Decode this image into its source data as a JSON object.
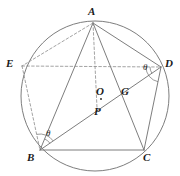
{
  "figure": {
    "kind": "circle-geometry-diagram",
    "width": 180,
    "height": 176,
    "background_color": "#ffffff",
    "stroke_color": "#6e6e6e",
    "dashed_color": "#8c8c8c",
    "label_color": "#1a1a1a"
  },
  "circle": {
    "name": "circumcircle",
    "center_x": 95,
    "center_y": 96,
    "radius_x": 74,
    "radius_y": 75
  },
  "points": [
    {
      "id": "A",
      "label": "A",
      "x": 93,
      "y": 23,
      "label_x": 88,
      "label_y": 6,
      "marker": false
    },
    {
      "id": "E",
      "label": "E",
      "x": 22,
      "y": 66,
      "label_x": 6,
      "label_y": 58,
      "marker": false
    },
    {
      "id": "D",
      "label": "D",
      "x": 161,
      "y": 67,
      "label_x": 165,
      "label_y": 58,
      "marker": false
    },
    {
      "id": "B",
      "label": "B",
      "x": 40,
      "y": 150,
      "label_x": 27,
      "label_y": 152,
      "marker": false
    },
    {
      "id": "C",
      "label": "C",
      "x": 144,
      "y": 150,
      "label_x": 143,
      "label_y": 152,
      "marker": false
    },
    {
      "id": "O",
      "label": "O",
      "x": 101,
      "y": 99,
      "label_x": 96,
      "label_y": 86,
      "marker": true
    },
    {
      "id": "G",
      "label": "G",
      "x": 119,
      "y": 97,
      "label_x": 121,
      "label_y": 86,
      "marker": false
    },
    {
      "id": "P",
      "label": "P",
      "x": 97,
      "y": 108,
      "label_x": 94,
      "label_y": 106,
      "marker": false
    }
  ],
  "segments": [
    {
      "name": "segment-A-D",
      "from": "A",
      "to": "D",
      "style": "solid"
    },
    {
      "name": "segment-A-B",
      "from": "A",
      "to": "B",
      "style": "solid"
    },
    {
      "name": "segment-A-C",
      "from": "A",
      "to": "C",
      "style": "solid"
    },
    {
      "name": "segment-B-C",
      "from": "B",
      "to": "C",
      "style": "solid"
    },
    {
      "name": "segment-B-D",
      "from": "B",
      "to": "D",
      "style": "solid"
    },
    {
      "name": "segment-C-D",
      "from": "C",
      "to": "D",
      "style": "solid"
    },
    {
      "name": "segment-A-E",
      "from": "A",
      "to": "E",
      "style": "dashed"
    },
    {
      "name": "segment-E-B",
      "from": "E",
      "to": "B",
      "style": "dashed"
    },
    {
      "name": "segment-E-D",
      "from": "E",
      "to": "D",
      "style": "dashed"
    },
    {
      "name": "segment-A-P",
      "from": "A",
      "to": "P",
      "style": "dashed"
    }
  ],
  "angles": [
    {
      "id": "theta-at-D",
      "label": "θ",
      "vertex": "D",
      "label_x": 143,
      "label_y": 63
    },
    {
      "id": "theta-at-B",
      "label": "θ",
      "vertex": "B",
      "label_x": 46,
      "label_y": 129
    }
  ]
}
